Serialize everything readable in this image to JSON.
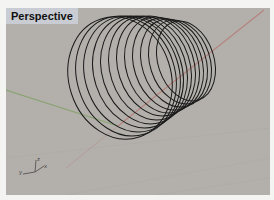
{
  "viewport": {
    "title": "Perspective",
    "background": "#b3b0ab"
  },
  "axes": {
    "x_color": "#b5837e",
    "y_color": "#8aa372"
  },
  "axis_widget": {
    "z_label": "z",
    "y_label": "y",
    "x_label": "x"
  },
  "geometry": {
    "type": "conical-helix",
    "turns": 12,
    "stroke": "#1a1a1a"
  }
}
